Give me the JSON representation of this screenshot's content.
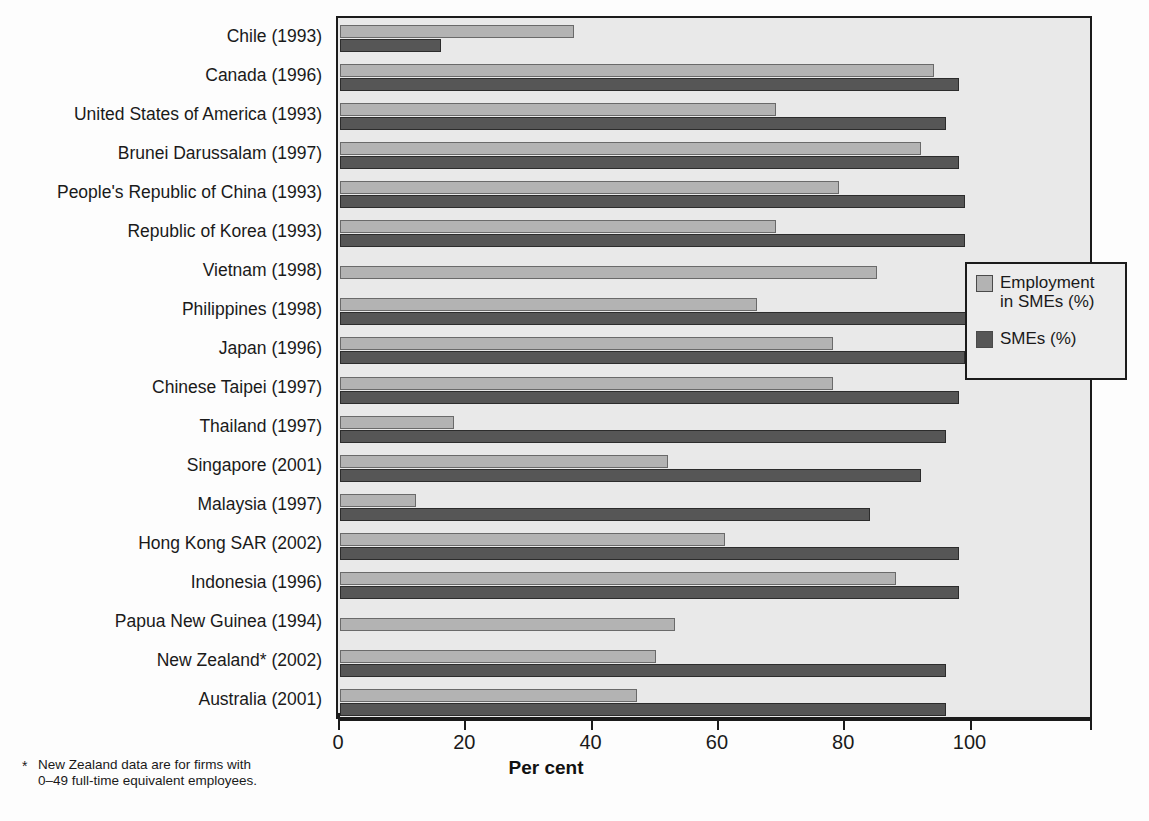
{
  "chart_data": {
    "type": "bar",
    "orientation": "horizontal",
    "title": "",
    "xlabel": "Per cent",
    "ylabel": "",
    "xlim": [
      0,
      119
    ],
    "xticks": [
      0,
      20,
      40,
      60,
      80,
      100
    ],
    "grid": false,
    "legend_position": "right-middle",
    "categories": [
      "Chile (1993)",
      "Canada (1996)",
      "United States of America (1993)",
      "Brunei Darussalam (1997)",
      "People's Republic of China (1993)",
      "Republic of Korea (1993)",
      "Vietnam (1998)",
      "Philippines (1998)",
      "Japan (1996)",
      "Chinese Taipei (1997)",
      "Thailand (1997)",
      "Singapore (2001)",
      "Malaysia (1997)",
      "Hong Kong SAR (2002)",
      "Indonesia (1996)",
      "Papua New Guinea (1994)",
      "New Zealand* (2002)",
      "Australia (2001)"
    ],
    "series": [
      {
        "name": "Employment in SMEs (%)",
        "color": "#b3b3b3",
        "values": [
          37,
          94,
          69,
          92,
          79,
          69,
          85,
          66,
          78,
          78,
          18,
          52,
          12,
          61,
          88,
          53,
          50,
          47
        ]
      },
      {
        "name": "SMEs (%)",
        "color": "#565656",
        "values": [
          16,
          98,
          96,
          98,
          99,
          99,
          null,
          100,
          99,
          98,
          96,
          92,
          84,
          98,
          98,
          null,
          96,
          96
        ]
      }
    ],
    "footnote": "New Zealand data are for firms with 0–49 full-time equivalent employees."
  },
  "legend": {
    "items": [
      {
        "label_line1": "Employment",
        "label_line2": "in SMEs (%)",
        "swatch": "light"
      },
      {
        "label_line1": "SMEs (%)",
        "label_line2": "",
        "swatch": "dark"
      }
    ]
  },
  "axis": {
    "tick_labels": [
      "0",
      "20",
      "40",
      "60",
      "80",
      "100"
    ],
    "title": "Per cent"
  },
  "footnote": {
    "marker": "*",
    "line1": "New Zealand data are for firms with",
    "line2": "0–49 full-time equivalent employees."
  },
  "colors": {
    "light_bar": "#b3b3b3",
    "dark_bar": "#565656",
    "plot_background": "#e9e9e9",
    "frame": "#1b1b1b"
  }
}
